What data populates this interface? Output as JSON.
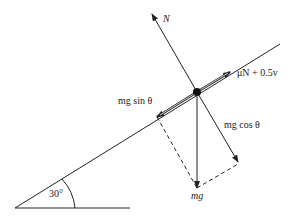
{
  "diagram": {
    "angle_label": "30°",
    "forces": {
      "normal": "N",
      "friction": "μN + 0.5v",
      "parallel_component": "mg  sin θ",
      "perpendicular_component": "mg  cos θ",
      "weight": "mg"
    },
    "colors": {
      "line": "#222222",
      "background": "#ffffff"
    }
  }
}
